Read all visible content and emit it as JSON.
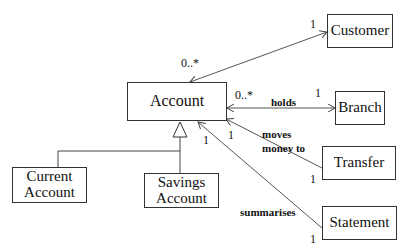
{
  "diagram": {
    "type": "UML class diagram",
    "classes": [
      {
        "id": "account",
        "name": "Account"
      },
      {
        "id": "customer",
        "name": "Customer"
      },
      {
        "id": "branch",
        "name": "Branch"
      },
      {
        "id": "transfer",
        "name": "Transfer"
      },
      {
        "id": "statement",
        "name": "Statement"
      },
      {
        "id": "current_account",
        "line1": "Current",
        "line2": "Account"
      },
      {
        "id": "savings_account",
        "line1": "Savings",
        "line2": "Account"
      }
    ],
    "associations": [
      {
        "from": "account",
        "to": "customer",
        "label": "",
        "from_mult": "0..*",
        "to_mult": "1"
      },
      {
        "from": "account",
        "to": "branch",
        "label": "holds",
        "from_mult": "0..*",
        "to_mult": "1"
      },
      {
        "from": "transfer",
        "to": "account",
        "label_line1": "moves",
        "label_line2": "money to",
        "from_mult": "1",
        "to_mult": "1"
      },
      {
        "from": "statement",
        "to": "account",
        "label": "summarises",
        "from_mult": "1",
        "to_mult": "1"
      }
    ],
    "generalization": {
      "parent": "account",
      "children": [
        "current_account",
        "savings_account"
      ]
    }
  }
}
